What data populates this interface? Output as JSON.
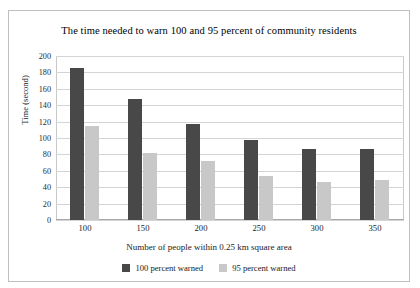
{
  "chart_data": {
    "type": "bar",
    "title": "The time needed to warn 100 and 95 percent of community residents",
    "xlabel": "Number of people within 0.25 km square area",
    "ylabel": "Time (second)",
    "categories": [
      "100",
      "150",
      "200",
      "250",
      "300",
      "350"
    ],
    "series": [
      {
        "name": "100 percent warned",
        "color": "#484848",
        "values": [
          185,
          147,
          117,
          98,
          87,
          86
        ]
      },
      {
        "name": "95 percent warned",
        "color": "#c8c8c8",
        "values": [
          115,
          82,
          72,
          54,
          46,
          49
        ]
      }
    ],
    "ylim": [
      0,
      200
    ],
    "yticks": [
      "0",
      "20",
      "40",
      "60",
      "80",
      "100",
      "120",
      "140",
      "160",
      "180",
      "200"
    ],
    "ytick_values": [
      0,
      20,
      40,
      60,
      80,
      100,
      120,
      140,
      160,
      180,
      200
    ],
    "grid": true,
    "legend_position": "bottom"
  }
}
